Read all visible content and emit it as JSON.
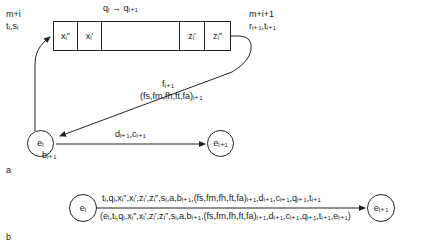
{
  "figure": {
    "panel_a": {
      "label": "a",
      "top_transition": "qᵢ → qᵢ₊₁",
      "left_label_line1": "m+i",
      "left_label_line2": "tᵢ,sᵢ",
      "right_label_line1": "m+i+1",
      "right_label_line2": "rᵢ₊₁,tᵢ₊₁",
      "tape_cells": [
        {
          "name": "cell-x-double-prime",
          "text": "xᵢ″"
        },
        {
          "name": "cell-x-prime",
          "text": "xᵢ′"
        },
        {
          "name": "cell-blank",
          "text": ""
        },
        {
          "name": "cell-z-prime",
          "text": "zᵢ′"
        },
        {
          "name": "cell-z-double-prime",
          "text": "zᵢ″"
        }
      ],
      "feedback_label_line1": "fᵢ₊₁",
      "feedback_label_line2": "(fs,fm,fh,ft,fa)ᵢ₊₁",
      "node_left": "eᵢ",
      "node_right": "eᵢ₊₁",
      "edge_label_top": "dᵢ₊₁,cᵢ₊₁",
      "edge_label_bottom": "bᵢ₊₁"
    },
    "panel_b": {
      "label": "b",
      "node_left": "eᵢ",
      "node_right": "eᵢ₊₁",
      "edge_label_above": "tᵢ,qᵢ,xᵢ″,xᵢ′,zᵢ′,zᵢ″,sᵢ,a,bᵢ₊₁,(fs,fm,fh,ft,fa)ᵢ₊₁,dᵢ₊₁,cᵢ₊₁,qᵢ₊₁,tᵢ₊₁",
      "edge_label_below": "(eᵢ,tᵢ,qᵢ,xᵢ″,xᵢ′,zᵢ′,zᵢ″,sᵢ,a,bᵢ₊₁,(fs,fm,fh,ft,fa)ᵢ₊₁,dᵢ₊₁,cᵢ₊₁,qᵢ₊₁,tᵢ₊₁,eᵢ₊₁)"
    },
    "colors": {
      "stroke": "#222222",
      "text": "#1a1a1a",
      "background": "#ffffff"
    }
  }
}
